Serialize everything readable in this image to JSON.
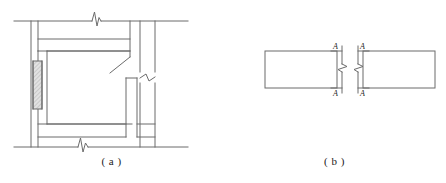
{
  "figure": {
    "background_color": "#ffffff",
    "line_color": "#6b6b6b",
    "line_color_dark": "#4a4a4a",
    "text_color": "#1a1a1a",
    "hatch_fill_color": "#cfcfcf",
    "line_width": 1
  },
  "panels": [
    {
      "id": "panel-a",
      "caption": "( a )",
      "description": "Frame elevation with columns, beams, infill wall and break lines",
      "elements": {
        "left_column_label": "left column",
        "right_column_label": "right column",
        "top_beam_label": "top beam",
        "bottom_beam_label": "bottom beam",
        "infill_wall_label": "infill wall",
        "interior_column_label": "interior column",
        "leader_line_label": "leader line",
        "break_symbol_count": 3
      }
    },
    {
      "id": "panel-b",
      "caption": "( b )",
      "description": "Two beam segments separated by break lines with section cut A-A",
      "elements": {
        "left_segment_label": "left beam segment",
        "right_segment_label": "right beam segment",
        "break_symbol_count": 2
      },
      "section_marks": [
        {
          "id": "section-mark-top-left",
          "label": "A"
        },
        {
          "id": "section-mark-top-right",
          "label": "A"
        },
        {
          "id": "section-mark-bottom-left",
          "label": "A"
        },
        {
          "id": "section-mark-bottom-right",
          "label": "A"
        }
      ]
    }
  ],
  "labels": {
    "section_a": "A"
  }
}
